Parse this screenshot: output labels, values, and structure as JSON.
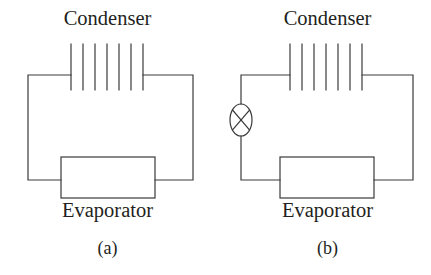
{
  "figure": {
    "type": "schematic-diagram",
    "background_color": "#ffffff",
    "line_color": "#3a3a3a",
    "text_color": "#231f20",
    "panels": [
      {
        "id": "a",
        "sub_label": "(a)",
        "top_label": "Condenser",
        "bottom_label": "Evaporator",
        "components": [
          {
            "name": "condenser",
            "icon": "condenser-fins-icon",
            "fin_count": 7
          },
          {
            "name": "evaporator",
            "icon": "evaporator-box-icon"
          },
          {
            "name": "circuit-loop",
            "icon": "piping-loop-icon"
          }
        ],
        "has_expansion_valve": false
      },
      {
        "id": "b",
        "sub_label": "(b)",
        "top_label": "Condenser",
        "bottom_label": "Evaporator",
        "components": [
          {
            "name": "condenser",
            "icon": "condenser-fins-icon",
            "fin_count": 7
          },
          {
            "name": "evaporator",
            "icon": "evaporator-box-icon"
          },
          {
            "name": "expansion-valve",
            "icon": "valve-crossed-circle-icon"
          },
          {
            "name": "circuit-loop",
            "icon": "piping-loop-icon"
          }
        ],
        "has_expansion_valve": true
      }
    ]
  }
}
